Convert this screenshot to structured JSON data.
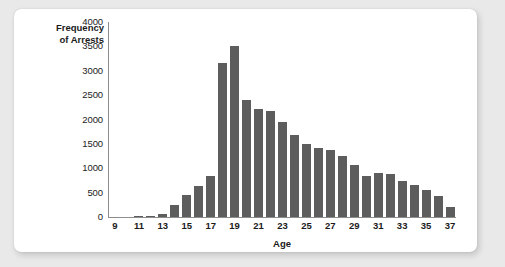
{
  "chart_data": {
    "type": "bar",
    "title": "",
    "xlabel": "Age",
    "ylabel": "Frequency of Arrests",
    "ylabel_line1": "Frequency",
    "ylabel_line2": "of Arrests",
    "ylim": [
      0,
      4000
    ],
    "y_ticks": [
      0,
      500,
      1000,
      1500,
      2000,
      2500,
      3000,
      3500,
      4000
    ],
    "y_tick_labels": [
      "0",
      "500",
      "1000",
      "1500",
      "2000",
      "2500",
      "3000",
      "3500",
      "4000"
    ],
    "x_tick_labels": [
      "9",
      "11",
      "13",
      "15",
      "17",
      "19",
      "21",
      "23",
      "25",
      "27",
      "29",
      "31",
      "33",
      "35",
      "37"
    ],
    "grid": false,
    "legend": false,
    "bar_color": "#5d5d5d",
    "categories": [
      9,
      10,
      11,
      12,
      13,
      14,
      15,
      16,
      17,
      18,
      19,
      20,
      21,
      22,
      23,
      24,
      25,
      26,
      27,
      28,
      29,
      30,
      31,
      32,
      33,
      34,
      35,
      36,
      37
    ],
    "values": [
      0,
      0,
      25,
      30,
      60,
      240,
      450,
      630,
      840,
      3150,
      3500,
      2400,
      2210,
      2170,
      1940,
      1680,
      1500,
      1420,
      1370,
      1250,
      1070,
      850,
      910,
      890,
      740,
      650,
      550,
      430,
      210
    ]
  },
  "figure": {
    "background_color": "#e9e9ea",
    "card_color": "#ffffff"
  }
}
